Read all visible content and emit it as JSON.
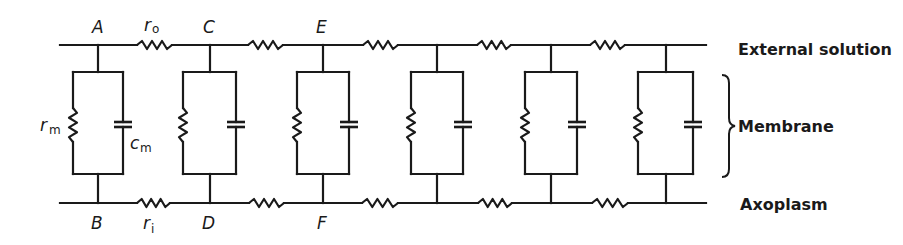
{
  "regions": {
    "external": "External solution",
    "membrane": "Membrane",
    "axoplasm": "Axoplasm"
  },
  "node_labels": {
    "top": [
      "A",
      "C",
      "E"
    ],
    "bottom": [
      "B",
      "D",
      "F"
    ]
  },
  "symbols": {
    "r_o": {
      "base": "r",
      "sub": "o"
    },
    "r_i": {
      "base": "r",
      "sub": "i"
    },
    "r_m": {
      "base": "r",
      "sub": "m"
    },
    "c_m": {
      "base": "c",
      "sub": "m"
    }
  },
  "colors": {
    "line": "#1a1a1a",
    "background": "#ffffff"
  },
  "layout": {
    "top_y": 45,
    "bottom_y": 203,
    "line_start_x": 60,
    "line_end_x": 706,
    "box_top_y": 72,
    "box_bottom_y": 174,
    "sections": [
      {
        "x": 98,
        "box_left": 73,
        "box_right": 123
      },
      {
        "x": 210,
        "box_left": 183,
        "box_right": 236
      },
      {
        "x": 323,
        "box_left": 297,
        "box_right": 349
      },
      {
        "x": 437,
        "box_left": 411,
        "box_right": 463
      },
      {
        "x": 551,
        "box_left": 525,
        "box_right": 577
      },
      {
        "x": 666,
        "box_left": 638,
        "box_right": 693
      }
    ],
    "top_resistors": [
      [
        137,
        172
      ],
      [
        248,
        283
      ],
      [
        363,
        398
      ],
      [
        477,
        511
      ],
      [
        590,
        625
      ]
    ],
    "bottom_resistors": [
      [
        137,
        170
      ],
      [
        249,
        284
      ],
      [
        362,
        398
      ],
      [
        478,
        512
      ],
      [
        592,
        628
      ]
    ]
  }
}
